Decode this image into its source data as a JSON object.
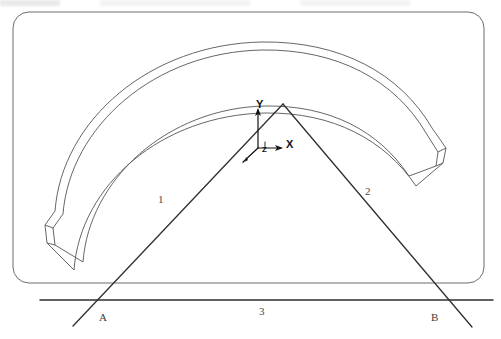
{
  "figure": {
    "background_color": "#ffffff",
    "line_color": "#3a3a3a",
    "heavy_line_color": "#2b2b2b",
    "width": 501,
    "height": 339
  },
  "labels": {
    "line_1": "1",
    "line_2": "2",
    "line_3": "3",
    "point_a": "A",
    "point_b": "B"
  },
  "axes": {
    "x": "X",
    "y": "Y",
    "z": "Z",
    "origin_x": 258,
    "origin_y": 148
  },
  "geometry": {
    "frame": {
      "x": 13,
      "y": 12,
      "width": 471,
      "height": 271,
      "radius": 16
    },
    "apex": {
      "x": 283,
      "y": 104
    },
    "leg1_end": {
      "x": 73,
      "y": 326
    },
    "leg2_end": {
      "x": 472,
      "y": 327
    },
    "ground_line": {
      "x1": 40,
      "y1": 300,
      "x2": 493,
      "y2": 300
    },
    "arc_crown_outer_y": 42,
    "arc_crown_mid_y": 50,
    "arc_crown_inner_y": 97
  },
  "label_positions": {
    "line_1": {
      "x": 158,
      "y": 194
    },
    "line_2": {
      "x": 365,
      "y": 186
    },
    "line_3": {
      "x": 259,
      "y": 306
    },
    "point_a": {
      "x": 99,
      "y": 312
    },
    "point_b": {
      "x": 431,
      "y": 312
    },
    "x": {
      "x": 286,
      "y": 139
    },
    "y": {
      "x": 256,
      "y": 99
    },
    "z": {
      "x": 262,
      "y": 146
    }
  }
}
